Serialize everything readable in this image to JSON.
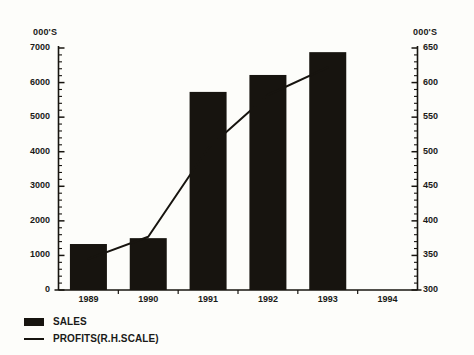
{
  "chart_data": {
    "type": "bar",
    "title": "",
    "xlabel": "",
    "categories": [
      "1989",
      "1990",
      "1991",
      "1992",
      "1993",
      "1994"
    ],
    "grid": false,
    "legend_position": "bottom-left",
    "left_axis": {
      "label": "000'S",
      "ylim": [
        0,
        7000
      ],
      "ticks": [
        7000,
        6000,
        5000,
        4000,
        3000,
        2000,
        1000,
        0
      ],
      "minor_tick_step": 200
    },
    "right_axis": {
      "label": "000'S",
      "ylim": [
        300,
        650
      ],
      "ticks": [
        650,
        600,
        550,
        500,
        450,
        400,
        350,
        300
      ],
      "minor_tick_step": 10
    },
    "series": [
      {
        "name": "SALES",
        "type": "bar",
        "axis": "left",
        "color": "#17140f",
        "values": [
          1330,
          1500,
          5730,
          6220,
          6880,
          null
        ]
      },
      {
        "name": "PROFITS(R.H.SCALE)",
        "type": "line",
        "axis": "right",
        "color": "#17140f",
        "values": [
          345,
          377,
          505,
          582,
          622,
          null
        ]
      }
    ]
  },
  "legend": {
    "items": [
      {
        "label": "SALES",
        "marker": "bar-swatch"
      },
      {
        "label": "PROFITS(R.H.SCALE)",
        "marker": "line-swatch"
      }
    ]
  }
}
